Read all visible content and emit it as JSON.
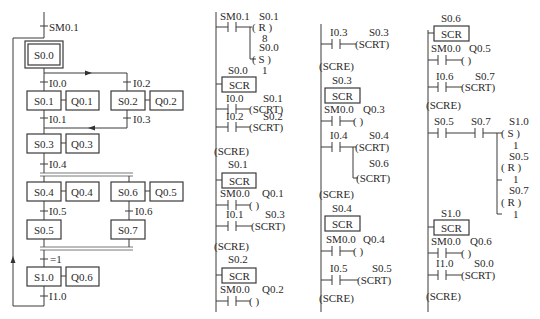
{
  "sfc": {
    "initial_transition": "SM0.1",
    "steps": {
      "s00": "S0.0",
      "s01": "S0.1",
      "q01": "Q0.1",
      "s02": "S0.2",
      "q02": "Q0.2",
      "s03": "S0.3",
      "q03": "Q0.3",
      "s04": "S0.4",
      "q04": "Q0.4",
      "s06": "S0.6",
      "q05": "Q0.5",
      "s05": "S0.5",
      "s07": "S0.7",
      "s10": "S1.0",
      "q06": "Q0.6"
    },
    "transitions": {
      "t00": "I0.0",
      "t02": "I0.2",
      "t01": "I0.1",
      "t03": "I0.3",
      "t04": "I0.4",
      "t05": "I0.5",
      "t06": "I0.6",
      "teq": "=1",
      "t10": "I1.0"
    }
  },
  "ladder": {
    "col1": {
      "init_contact": "SM0.1",
      "reset_coil_addr": "S0.1",
      "reset_coil": "( R )",
      "reset_n": "8",
      "set_coil_addr": "S0.0",
      "set_coil": "( S )",
      "set_n": "1",
      "scr_s00_label": "S0.0",
      "scr": "SCR",
      "c_i00": "I0.0",
      "scrt_s01_addr": "S0.1",
      "scrt": "(SCRT)",
      "c_i02": "I0.2",
      "scrt_s02_addr": "S0.2",
      "scre": "(SCRE)",
      "scr_s01_label": "S0.1",
      "c_sm00_a": "SM0.0",
      "out_q01": "Q0.1",
      "coil_empty": "(    )",
      "c_i01": "I0.1",
      "scrt_s03_addr": "S0.3",
      "scr_s02_label": "S0.2",
      "c_sm00_b": "SM0.0",
      "out_q02": "Q0.2"
    },
    "col2": {
      "c_i03": "I0.3",
      "scrt_s03_addr": "S0.3",
      "scrt": "(SCRT)",
      "scre": "(SCRE)",
      "scr_s03_label": "S0.3",
      "scr": "SCR",
      "c_sm00_a": "SM0.0",
      "out_q03": "Q0.3",
      "coil_empty": "(    )",
      "c_i04": "I0.4",
      "scrt_s04_addr": "S0.4",
      "scrt_s06_addr": "S0.6",
      "scr_s04_label": "S0.4",
      "c_sm00_b": "SM0.0",
      "out_q04": "Q0.4",
      "c_i05": "I0.5",
      "scrt_s05_addr": "S0.5"
    },
    "col3": {
      "scr_s06_label": "S0.6",
      "scr": "SCR",
      "c_sm00_a": "SM0.0",
      "out_q05": "Q0.5",
      "coil_empty": "(    )",
      "c_i06": "I0.6",
      "scrt_s07_addr": "S0.7",
      "scrt": "(SCRT)",
      "scre": "(SCRE)",
      "c_s05": "S0.5",
      "c_s07": "S0.7",
      "set_s10_addr": "S1.0",
      "set_coil": "( S )",
      "set_n": "1",
      "reset_s05_addr": "S0.5",
      "reset_coil": "( R )",
      "reset_n1": "1",
      "reset_s07_addr": "S0.7",
      "reset_n2": "1",
      "scr_s10_label": "S1.0",
      "c_sm00_b": "SM0.0",
      "out_q06": "Q0.6",
      "c_i10": "I1.0",
      "scrt_s00_addr": "S0.0"
    }
  }
}
